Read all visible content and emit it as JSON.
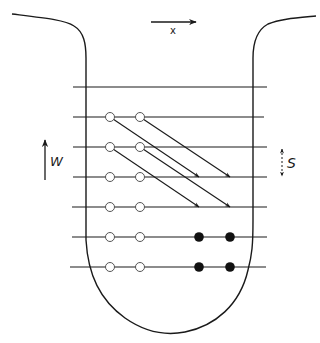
{
  "diagram": {
    "type": "schematic",
    "colors": {
      "stroke": "#1a1a1a",
      "background": "#ffffff",
      "open_marker_fill": "#ffffff",
      "filled_marker_fill": "#111111"
    },
    "labels": {
      "x_axis": "x",
      "w_label": "W",
      "s_label": "S"
    },
    "layers": {
      "count": 7,
      "y_positions": [
        87,
        117,
        147,
        177,
        207,
        237,
        267
      ]
    },
    "open_markers": [
      {
        "row": 2,
        "x": [
          110,
          140
        ]
      },
      {
        "row": 3,
        "x": [
          110,
          140
        ]
      },
      {
        "row": 4,
        "x": [
          110,
          140
        ]
      },
      {
        "row": 5,
        "x": [
          110,
          140
        ]
      },
      {
        "row": 6,
        "x": [
          110,
          140
        ]
      },
      {
        "row": 7,
        "x": [
          110,
          140
        ]
      }
    ],
    "filled_markers": [
      {
        "row": 6,
        "x": [
          199,
          230
        ]
      },
      {
        "row": 7,
        "x": [
          199,
          230
        ]
      }
    ],
    "diagonal_arrows": [
      {
        "from": [
          110,
          117
        ],
        "to": [
          199,
          177
        ]
      },
      {
        "from": [
          140,
          117
        ],
        "to": [
          230,
          177
        ]
      },
      {
        "from": [
          110,
          147
        ],
        "to": [
          199,
          207
        ]
      },
      {
        "from": [
          140,
          147
        ],
        "to": [
          230,
          207
        ]
      }
    ],
    "arrows": {
      "x_direction": "right",
      "w_direction": "up",
      "s_direction": "up-down (dashed)"
    }
  }
}
